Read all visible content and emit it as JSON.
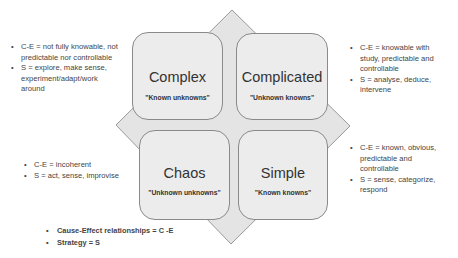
{
  "colors": {
    "diamond_fill": "#e4e4e4",
    "diamond_stroke": "#9a9a9a",
    "quad_fill": "#ececec",
    "quad_border": "#8a8a8a",
    "text": "#333333"
  },
  "quadrants": [
    {
      "id": "complex",
      "title": "Complex",
      "subtitle": "\"Known unknowns\""
    },
    {
      "id": "complicated",
      "title": "Complicated",
      "subtitle": "\"Unknown knowns\""
    },
    {
      "id": "chaos",
      "title": "Chaos",
      "subtitle": "\"Unknown unknowns\""
    },
    {
      "id": "simple",
      "title": "Simple",
      "subtitle": "\"Known knowns\""
    }
  ],
  "notes": {
    "complex": [
      "C-E = not fully knowable, not predictable nor controllable",
      "S = explore, make sense, experiment/adapt/work around"
    ],
    "complicated": [
      "C-E = knowable with study, predictable and controllable",
      "S = analyse, deduce, intervene"
    ],
    "chaos": [
      "C-E = incoherent",
      "S = act, sense, improvise"
    ],
    "simple": [
      "C-E = known, obvious, predictable and controllable",
      "S = sense, categorize, respond"
    ]
  },
  "legend": [
    "Cause-Effect relationships = C -E",
    "Strategy = S"
  ],
  "bullet_glyph": "•"
}
